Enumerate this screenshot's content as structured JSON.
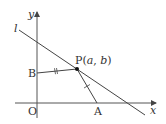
{
  "diagram": {
    "labels": {
      "y_axis": "y",
      "x_axis": "x",
      "line": "l",
      "origin": "O",
      "point_p": "P(",
      "point_p_a": "a",
      "point_p_sep": ", ",
      "point_p_b": "b",
      "point_p_close": ")",
      "point_b": "B",
      "point_a": "A"
    },
    "points": {
      "O": [
        37,
        103
      ],
      "P": [
        77,
        69
      ],
      "A": [
        97,
        103
      ],
      "B": [
        37,
        73
      ]
    },
    "colors": {
      "stroke": "#444444",
      "text": "#333333"
    }
  }
}
